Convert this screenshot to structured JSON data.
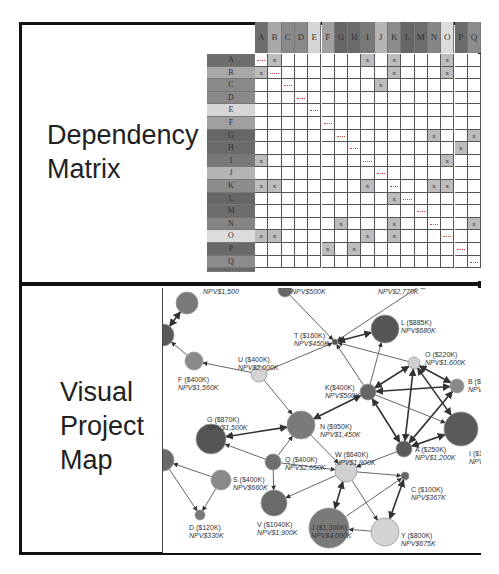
{
  "panels": {
    "top": {
      "label_line1": "Dependency",
      "label_line2": "Matrix"
    },
    "bottom": {
      "label_line1": "Visual",
      "label_line2": "Project",
      "label_line3": "Map"
    }
  },
  "matrix": {
    "columns": [
      {
        "label": "A",
        "color": "#6e6e6e"
      },
      {
        "label": "B",
        "color": "#a8a8a8"
      },
      {
        "label": "C",
        "color": "#8a8a8a"
      },
      {
        "label": "D",
        "color": "#8a8a8a"
      },
      {
        "label": "E",
        "color": "#d6d6d6"
      },
      {
        "label": "F",
        "color": "#a0a0a0"
      },
      {
        "label": "G",
        "color": "#666666"
      },
      {
        "label": "H",
        "color": "#6a6a6a"
      },
      {
        "label": "I",
        "color": "#787878"
      },
      {
        "label": "J",
        "color": "#b4b4b4"
      },
      {
        "label": "K",
        "color": "#8c8c8c"
      },
      {
        "label": "L",
        "color": "#666666"
      },
      {
        "label": "M",
        "color": "#6c6c6c"
      },
      {
        "label": "N",
        "color": "#858585"
      },
      {
        "label": "O",
        "color": "#dcdcdc"
      },
      {
        "label": "P",
        "color": "#6a6a6a"
      },
      {
        "label": "Q",
        "color": "#8c8c8c"
      }
    ],
    "rows": [
      {
        "label": "A",
        "color": "#6e6e6e",
        "x": [
          1,
          8,
          10,
          14
        ],
        "diag": 0
      },
      {
        "label": "B",
        "color": "#a8a8a8",
        "x": [
          0,
          10,
          14
        ],
        "diag": 1
      },
      {
        "label": "C",
        "color": "#8a8a8a",
        "x": [
          9
        ],
        "diag": 2
      },
      {
        "label": "D",
        "color": "#8a8a8a",
        "x": [],
        "diag": 3
      },
      {
        "label": "E",
        "color": "#d6d6d6",
        "x": [],
        "diag": 4
      },
      {
        "label": "F",
        "color": "#a0a0a0",
        "x": [],
        "diag": 5
      },
      {
        "label": "G",
        "color": "#666666",
        "x": [
          13,
          16
        ],
        "diag": 6
      },
      {
        "label": "H",
        "color": "#6a6a6a",
        "x": [
          15
        ],
        "diag": 7
      },
      {
        "label": "I",
        "color": "#787878",
        "x": [
          0,
          14
        ],
        "diag": 8
      },
      {
        "label": "J",
        "color": "#b4b4b4",
        "x": [],
        "diag": 9
      },
      {
        "label": "K",
        "color": "#8c8c8c",
        "x": [
          0,
          1,
          8,
          13,
          14
        ],
        "diag": 10
      },
      {
        "label": "L",
        "color": "#666666",
        "x": [
          10
        ],
        "diag": 11
      },
      {
        "label": "M",
        "color": "#6c6c6c",
        "x": [],
        "diag": 12
      },
      {
        "label": "N",
        "color": "#858585",
        "x": [
          6,
          10,
          16
        ],
        "diag": 13
      },
      {
        "label": "O",
        "color": "#dcdcdc",
        "x": [
          0,
          1,
          8,
          10
        ],
        "diag": 14
      },
      {
        "label": "P",
        "color": "#6a6a6a",
        "x": [
          5,
          7
        ],
        "diag": 15
      },
      {
        "label": "Q",
        "color": "#8c8c8c",
        "x": [],
        "diag": 16
      }
    ],
    "mark": "x"
  },
  "map": {
    "nodes": [
      {
        "id": "L",
        "name": "L ($885K)",
        "npv": "NPV$680K",
        "x": 222,
        "y": 41,
        "r": 14,
        "color": "#555555",
        "lx": 238,
        "ly": 31
      },
      {
        "id": "T",
        "name": "T ($160K)",
        "npv": "NPV$450K",
        "x": 172,
        "y": 54,
        "r": 3,
        "color": "#555555",
        "lx": 131,
        "ly": 44
      },
      {
        "id": "O",
        "name": "O ($220K)",
        "npv": "NPV$1,600K",
        "x": 251,
        "y": 75,
        "r": 6,
        "color": "#d0d0d0",
        "lx": 262,
        "ly": 63
      },
      {
        "id": "U",
        "name": "U ($400K)",
        "npv": "NPV$2,000K",
        "x": 96,
        "y": 86,
        "r": 8,
        "color": "#d4d4d4",
        "lx": 75,
        "ly": 68
      },
      {
        "id": "F",
        "name": "F ($400K)",
        "npv": "NPV$1,560K",
        "x": 31,
        "y": 73,
        "r": 9,
        "color": "#8a8a8a",
        "lx": 15,
        "ly": 88
      },
      {
        "id": "K",
        "name": "K($400K)",
        "npv": "NPV$500K",
        "x": 205,
        "y": 104,
        "r": 8,
        "color": "#666666",
        "lx": 162,
        "ly": 96
      },
      {
        "id": "B",
        "name": "B ($1",
        "npv": "NPV",
        "x": 294,
        "y": 98,
        "r": 7,
        "color": "#8a8a8a",
        "lx": 305,
        "ly": 90
      },
      {
        "id": "N",
        "name": "N ($950K)",
        "npv": "NPV$1,450K",
        "x": 138,
        "y": 137,
        "r": 14,
        "color": "#7a7a7a",
        "lx": 157,
        "ly": 135
      },
      {
        "id": "G",
        "name": "G ($870K)",
        "npv": "NPV$1,500K",
        "x": 48,
        "y": 151,
        "r": 15,
        "color": "#555555",
        "lx": 44,
        "ly": 128
      },
      {
        "id": "I",
        "name": "I ($1",
        "npv": "NPV",
        "x": 298,
        "y": 141,
        "r": 17,
        "color": "#5a5a5a",
        "lx": 306,
        "ly": 162
      },
      {
        "id": "A",
        "name": "A ($250K)",
        "npv": "NPV$1,200K",
        "x": 241,
        "y": 161,
        "r": 8,
        "color": "#5a5a5a",
        "lx": 252,
        "ly": 158
      },
      {
        "id": "W",
        "name": "W ($640K)",
        "npv": "NPV$1,900K",
        "x": 183,
        "y": 183,
        "r": 11,
        "color": "#d0d0d0",
        "lx": 172,
        "ly": 163
      },
      {
        "id": "Q",
        "name": "Q ($400K)",
        "npv": "NPV$2,650K",
        "x": 110,
        "y": 174,
        "r": 8,
        "color": "#6e6e6e",
        "lx": 122,
        "ly": 168
      },
      {
        "id": "S",
        "name": "S ($400K)",
        "npv": "NPV$660K",
        "x": 58,
        "y": 192,
        "r": 10,
        "color": "#8a8a8a",
        "lx": 70,
        "ly": 188
      },
      {
        "id": "C",
        "name": "C ($100K)",
        "npv": "NPV$367K",
        "x": 242,
        "y": 188,
        "r": 4,
        "color": "#666666",
        "lx": 248,
        "ly": 198
      },
      {
        "id": "V",
        "name": "V ($1040K)",
        "npv": "NPV$1,900K",
        "x": 111,
        "y": 215,
        "r": 13,
        "color": "#6a6a6a",
        "lx": 94,
        "ly": 233
      },
      {
        "id": "D",
        "name": "D ($120K)",
        "npv": "NPV$330K",
        "x": 37,
        "y": 227,
        "r": 5,
        "color": "#777777",
        "lx": 26,
        "ly": 236
      },
      {
        "id": "J",
        "name": "J ($1,300K)",
        "npv": "NPV$4,000K",
        "x": 166,
        "y": 240,
        "r": 20,
        "color": "#7a7a7a",
        "lx": 148,
        "ly": 236
      },
      {
        "id": "Y",
        "name": "Y ($800K)",
        "npv": "NPV$675K",
        "x": 222,
        "y": 244,
        "r": 14,
        "color": "#d4d4d4",
        "lx": 238,
        "ly": 244
      },
      {
        "id": "E1",
        "name": "",
        "npv": "NPV$1,500",
        "x": 24,
        "y": 15,
        "r": 11,
        "color": "#7a7a7a",
        "lx": 40,
        "ly": 0
      },
      {
        "id": "E2",
        "name": "",
        "npv": "NPV$500K",
        "x": 122,
        "y": 2,
        "r": 7,
        "color": "#666666",
        "lx": 128,
        "ly": 0
      },
      {
        "id": "E3",
        "name": "",
        "npv": "NPV$2,770K",
        "x": 260,
        "y": -4,
        "r": 5,
        "color": "#888888",
        "lx": 215,
        "ly": 0
      },
      {
        "id": "E4",
        "name": "",
        "npv": "",
        "x": 0,
        "y": 47,
        "r": 11,
        "color": "#5a5a5a",
        "lx": 0,
        "ly": 0
      },
      {
        "id": "E5",
        "name": "",
        "npv": "",
        "x": 0,
        "y": 172,
        "r": 11,
        "color": "#6a6a6a",
        "lx": 0,
        "ly": 0
      }
    ],
    "edges": [
      [
        "U",
        "T",
        false
      ],
      [
        "U",
        "F",
        false
      ],
      [
        "U",
        "N",
        false
      ],
      [
        "F",
        "E4",
        false
      ],
      [
        "E1",
        "E4",
        true
      ],
      [
        "T",
        "L",
        true
      ],
      [
        "E2",
        "T",
        false
      ],
      [
        "E3",
        "T",
        false
      ],
      [
        "O",
        "T",
        false
      ],
      [
        "K",
        "T",
        false
      ],
      [
        "K",
        "L",
        false
      ],
      [
        "K",
        "O",
        true
      ],
      [
        "K",
        "B",
        true
      ],
      [
        "O",
        "B",
        true
      ],
      [
        "O",
        "A",
        true
      ],
      [
        "O",
        "I",
        true
      ],
      [
        "B",
        "A",
        true
      ],
      [
        "K",
        "A",
        true
      ],
      [
        "K",
        "N",
        true
      ],
      [
        "K",
        "I",
        false
      ],
      [
        "G",
        "N",
        true
      ],
      [
        "Q",
        "N",
        false
      ],
      [
        "Q",
        "G",
        false
      ],
      [
        "Q",
        "V",
        false
      ],
      [
        "Q",
        "W",
        false
      ],
      [
        "N",
        "W",
        false
      ],
      [
        "A",
        "W",
        false
      ],
      [
        "I",
        "A",
        true
      ],
      [
        "W",
        "C",
        false
      ],
      [
        "W",
        "V",
        false
      ],
      [
        "W",
        "J",
        true
      ],
      [
        "W",
        "Y",
        false
      ],
      [
        "J",
        "C",
        false
      ],
      [
        "C",
        "Y",
        true
      ],
      [
        "Y",
        "J",
        false
      ],
      [
        "S",
        "D",
        false
      ],
      [
        "S",
        "E5",
        false
      ],
      [
        "E5",
        "D",
        false
      ]
    ]
  }
}
